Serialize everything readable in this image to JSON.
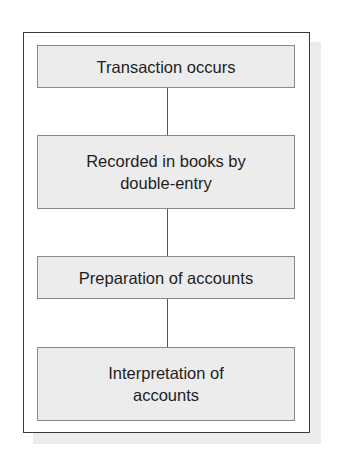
{
  "diagram": {
    "type": "flowchart",
    "direction": "top-to-bottom",
    "steps": [
      {
        "label": "Transaction occurs"
      },
      {
        "label": "Recorded in books by double-entry"
      },
      {
        "label": "Preparation of accounts"
      },
      {
        "label": "Interpretation of accounts"
      }
    ],
    "colors": {
      "box_fill": "#ececec",
      "box_border": "#8a8a8a",
      "frame_border": "#3a3a3a",
      "connector": "#555555",
      "text": "#1e1e1e"
    }
  }
}
